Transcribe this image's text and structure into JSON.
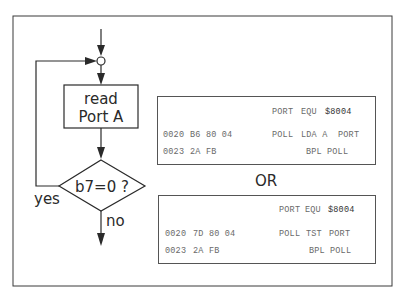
{
  "flowchart": {
    "process_box": {
      "line1": "read",
      "line2": "Port A"
    },
    "decision": {
      "label": "b7=0 ?"
    },
    "branch_yes": "yes",
    "branch_no": "no"
  },
  "separator": "OR",
  "listings": [
    {
      "header": {
        "label": "PORT",
        "op": "EQU",
        "operand": "$8004"
      },
      "rows": [
        {
          "addr": "0020",
          "bytes": "B6 80 04",
          "label": "POLL",
          "op": "LDA A",
          "operand": "PORT"
        },
        {
          "addr": "0023",
          "bytes": "2A FB",
          "label": "",
          "op": "BPL",
          "operand": "POLL"
        }
      ]
    },
    {
      "header": {
        "label": "PORT",
        "op": "EQU",
        "operand": "$8004"
      },
      "rows": [
        {
          "addr": "0020",
          "bytes": "7D 80 04",
          "label": "POLL",
          "op": "TST",
          "operand": "PORT"
        },
        {
          "addr": "0023",
          "bytes": "2A FB",
          "label": "",
          "op": "BPL",
          "operand": "POLL"
        }
      ]
    }
  ],
  "colors": {
    "line": "#2a2a2a",
    "code_text": "#6a6a6a",
    "background": "#ffffff"
  }
}
